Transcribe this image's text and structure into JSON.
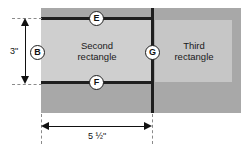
{
  "figure": {
    "regions": {
      "second": {
        "label_line1": "Second",
        "label_line2": "rectangle"
      },
      "third": {
        "label_line1": "Third",
        "label_line2": "rectangle"
      }
    },
    "callouts": [
      {
        "id": "E",
        "letter": "E",
        "refers_to": "top-horizontal-line"
      },
      {
        "id": "B",
        "letter": "B",
        "refers_to": "height-dimension"
      },
      {
        "id": "G",
        "letter": "G",
        "refers_to": "vertical-divider-line"
      },
      {
        "id": "F",
        "letter": "F",
        "refers_to": "bottom-horizontal-line"
      }
    ],
    "dimensions": {
      "height": {
        "value": "3\"",
        "orientation": "vertical"
      },
      "width": {
        "value": "5 ½\"",
        "orientation": "horizontal"
      }
    },
    "colors": {
      "outer_fill": "#a8a8a8",
      "second_fill": "#cfcfcf",
      "third_fill": "#c6c6c6",
      "line": "#1e1e1e",
      "dimension": "#111111",
      "extension": "#8a8a8a",
      "background": "#ffffff"
    }
  }
}
